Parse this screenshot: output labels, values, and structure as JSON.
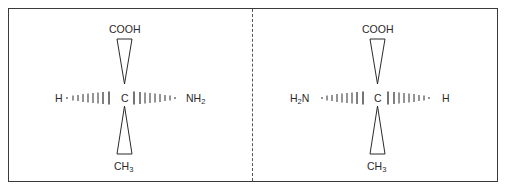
{
  "diagram": {
    "title": "",
    "type": "stereochemistry-projection",
    "panels": [
      {
        "id": "left",
        "center_atom": "C",
        "top": "COOH",
        "bottom_main": "CH",
        "bottom_sub": "3",
        "left": "H",
        "right_main": "NH",
        "right_sub": "2",
        "top_bond": "wedge",
        "bottom_bond": "wedge",
        "left_bond": "hashed",
        "right_bond": "hashed"
      },
      {
        "id": "right",
        "center_atom": "C",
        "top": "COOH",
        "bottom_main": "CH",
        "bottom_sub": "3",
        "left_main": "H",
        "left_sub": "2",
        "left_tail": "N",
        "right": "H",
        "top_bond": "wedge",
        "bottom_bond": "wedge",
        "left_bond": "hashed",
        "right_bond": "hashed"
      }
    ],
    "separator": "dashed-vertical-line",
    "colors": {
      "ink": "#2a2a2a",
      "border": "#3a3a3a",
      "background": "#ffffff"
    }
  }
}
